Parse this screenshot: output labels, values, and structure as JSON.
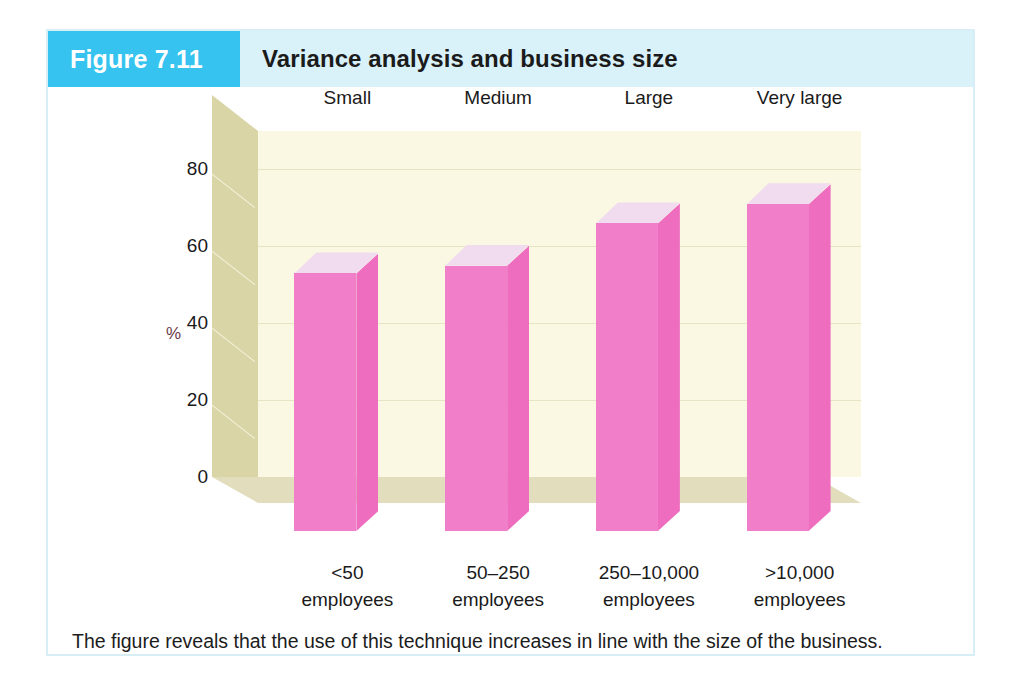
{
  "figure": {
    "badge": "Figure 7.11",
    "title": "Variance analysis and business size",
    "caption": "The figure reveals that the use of this technique increases in line with the size of the business.",
    "badge_color": "#36c3ef",
    "header_color": "#d9f2fa",
    "frame_color": "#d7eef7"
  },
  "chart_data": {
    "type": "bar",
    "title": "Variance analysis and business size",
    "xlabel": "",
    "ylabel": "%",
    "ylim": [
      0,
      90
    ],
    "yticks": [
      "0",
      "20",
      "40",
      "60",
      "80"
    ],
    "grid": true,
    "legend": "none",
    "categories": [
      "<50\nemployees",
      "50–250\nemployees",
      "250–10,000\nemployees",
      ">10,000\nemployees"
    ],
    "category_lines": [
      {
        "line1": "<50",
        "line2": "employees"
      },
      {
        "line1": "50–250",
        "line2": "employees"
      },
      {
        "line1": "250–10,000",
        "line2": "employees"
      },
      {
        "line1": ">10,000",
        "line2": "employees"
      }
    ],
    "size_labels": [
      "Small",
      "Medium",
      "Large",
      "Very large"
    ],
    "values": [
      67,
      69,
      80,
      85
    ],
    "colors": {
      "bar_front": "#f07ec8",
      "bar_side": "#ee6dbf",
      "bar_top": "#f1dbef",
      "back_wall": "#faf8e3",
      "side_wall": "#d9d5a6",
      "floor": "#e2debd",
      "grid_line": "#e7e4c4"
    }
  }
}
